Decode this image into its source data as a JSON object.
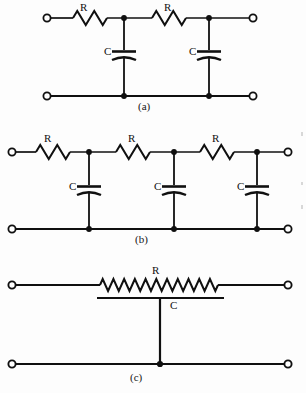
{
  "figure": {
    "background_color": "#fdfdfd",
    "line_color": "#101010",
    "label_color": "#111111"
  },
  "circuits": [
    {
      "id": "a",
      "caption": "(a)",
      "caption_x": 144,
      "caption_y": 103,
      "type": "two-section-rc-ladder",
      "stage_count": 2,
      "top_rail_y": 18,
      "bottom_rail_y": 96,
      "left_terminal_x": 47,
      "right_terminal_x": 253,
      "node_x": [
        124,
        209
      ],
      "resistors": [
        {
          "label": "R",
          "label_x": 84,
          "label_y": 3,
          "x1": 57,
          "x2": 124,
          "zig_start": 73,
          "zig_end": 107,
          "peaks": 3
        },
        {
          "label": "R",
          "label_x": 168,
          "label_y": 3,
          "x1": 124,
          "x2": 209,
          "zig_start": 152,
          "zig_end": 186,
          "peaks": 3
        }
      ],
      "capacitors": [
        {
          "label": "C",
          "label_x": 108,
          "label_y": 51,
          "x": 124,
          "plate_y": 54,
          "plate_half_width": 12
        },
        {
          "label": "C",
          "label_x": 193,
          "label_y": 51,
          "x": 209,
          "plate_y": 54,
          "plate_half_width": 12
        }
      ]
    },
    {
      "id": "b",
      "caption": "(b)",
      "caption_x": 140,
      "caption_y": 236,
      "type": "three-section-rc-ladder",
      "stage_count": 3,
      "top_rail_y": 152,
      "bottom_rail_y": 229,
      "left_terminal_x": 12,
      "right_terminal_x": 288,
      "node_x": [
        89,
        174,
        257
      ],
      "resistors": [
        {
          "label": "R",
          "label_x": 48,
          "label_y": 136,
          "x1": 20,
          "x2": 89,
          "zig_start": 36,
          "zig_end": 70,
          "peaks": 3
        },
        {
          "label": "R",
          "label_x": 132,
          "label_y": 136,
          "x1": 89,
          "x2": 174,
          "zig_start": 116,
          "zig_end": 150,
          "peaks": 3
        },
        {
          "label": "R",
          "label_x": 216,
          "label_y": 136,
          "x1": 174,
          "x2": 257,
          "zig_start": 200,
          "zig_end": 234,
          "peaks": 3
        }
      ],
      "capacitors": [
        {
          "label": "C",
          "label_x": 73,
          "label_y": 186,
          "x": 89,
          "plate_y": 189,
          "plate_half_width": 12
        },
        {
          "label": "C",
          "label_x": 157,
          "label_y": 186,
          "x": 174,
          "plate_y": 189,
          "plate_half_width": 12
        },
        {
          "label": "C",
          "label_x": 241,
          "label_y": 186,
          "x": 257,
          "plate_y": 189,
          "plate_half_width": 12
        }
      ]
    },
    {
      "id": "c",
      "caption": "(c)",
      "caption_x": 133,
      "caption_y": 373,
      "type": "distributed-rc-line",
      "stage_count": 1,
      "top_rail_y": 285,
      "bottom_rail_y": 364,
      "left_terminal_x": 12,
      "right_terminal_x": 288,
      "node_x": [
        160
      ],
      "resistors": [
        {
          "label": "R",
          "label_x": 155,
          "label_y": 268,
          "x1": 20,
          "x2": 280,
          "zig_start": 100,
          "zig_end": 218,
          "peaks": 11
        }
      ],
      "capacitors": [
        {
          "label": "C",
          "label_x": 173,
          "label_y": 300,
          "x": 160,
          "plate_y": 298,
          "plate_left": 97,
          "plate_right": 224,
          "distributed": true
        }
      ]
    }
  ],
  "component_labels": {
    "resistor": "R",
    "capacitor": "C"
  },
  "captions": [
    "(a)",
    "(b)",
    "(c)"
  ]
}
